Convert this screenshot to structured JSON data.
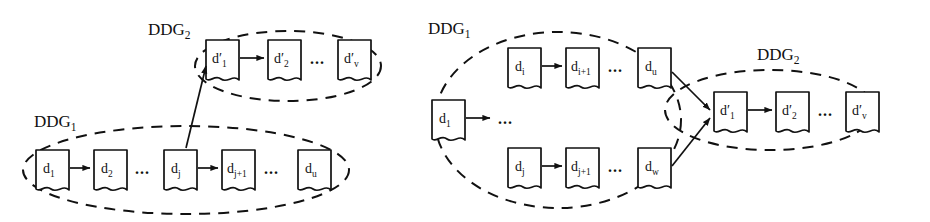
{
  "figure": {
    "type": "diagram",
    "ellipsis": "...",
    "colors": {
      "stroke": "#111111",
      "background": "#ffffff",
      "node_fill": "#ffffff"
    },
    "panels": [
      {
        "id": "panel-left",
        "name": "single-link-between-ddgs",
        "groups": [
          {
            "id": "left-ddg2",
            "label_base": "DDG",
            "label_sub": "2",
            "label": "DDG2",
            "nodes": [
              {
                "id": "l-dp1",
                "base": "d′",
                "sub": "1",
                "label": "d′1"
              },
              {
                "id": "l-dp2",
                "base": "d′",
                "sub": "2",
                "label": "d′2"
              },
              {
                "id": "l-dpv",
                "base": "d′",
                "sub": "v",
                "label": "d′v"
              }
            ]
          },
          {
            "id": "left-ddg1",
            "label_base": "DDG",
            "label_sub": "1",
            "label": "DDG1",
            "nodes": [
              {
                "id": "l-d1",
                "base": "d",
                "sub": "1",
                "label": "d1"
              },
              {
                "id": "l-d2",
                "base": "d",
                "sub": "2",
                "label": "d2"
              },
              {
                "id": "l-dj",
                "base": "d",
                "sub": "j",
                "label": "dj"
              },
              {
                "id": "l-dj1",
                "base": "d",
                "sub": "j+1",
                "label": "dj+1"
              },
              {
                "id": "l-du",
                "base": "d",
                "sub": "u",
                "label": "du"
              }
            ]
          }
        ],
        "edges": [
          {
            "from": "l-d1",
            "to": "l-d2",
            "kind": "intra-group"
          },
          {
            "from": "l-dj",
            "to": "l-dj1",
            "kind": "intra-group"
          },
          {
            "from": "l-dp1",
            "to": "l-dp2",
            "kind": "intra-group"
          },
          {
            "from": "l-dj",
            "to": "l-dp1",
            "kind": "cross-group"
          }
        ]
      },
      {
        "id": "panel-right",
        "name": "multi-link-between-ddgs",
        "groups": [
          {
            "id": "right-ddg1",
            "label_base": "DDG",
            "label_sub": "1",
            "label": "DDG1",
            "nodes": [
              {
                "id": "r-d1",
                "base": "d",
                "sub": "1",
                "label": "d1"
              },
              {
                "id": "r-di",
                "base": "d",
                "sub": "i",
                "label": "di"
              },
              {
                "id": "r-di1",
                "base": "d",
                "sub": "i+1",
                "label": "di+1"
              },
              {
                "id": "r-du",
                "base": "d",
                "sub": "u",
                "label": "du"
              },
              {
                "id": "r-dj",
                "base": "d",
                "sub": "j",
                "label": "dj"
              },
              {
                "id": "r-dj1",
                "base": "d",
                "sub": "j+1",
                "label": "dj+1"
              },
              {
                "id": "r-dw",
                "base": "d",
                "sub": "w",
                "label": "dw"
              }
            ]
          },
          {
            "id": "right-ddg2",
            "label_base": "DDG",
            "label_sub": "2",
            "label": "DDG2",
            "nodes": [
              {
                "id": "r-dp1",
                "base": "d′",
                "sub": "1",
                "label": "d′1"
              },
              {
                "id": "r-dp2",
                "base": "d′",
                "sub": "2",
                "label": "d′2"
              },
              {
                "id": "r-dpv",
                "base": "d′",
                "sub": "v",
                "label": "d′v"
              }
            ]
          }
        ],
        "edges": [
          {
            "from": "r-d1",
            "to": "ellipsis",
            "kind": "intra-group"
          },
          {
            "from": "r-di",
            "to": "r-di1",
            "kind": "intra-group"
          },
          {
            "from": "r-dj",
            "to": "r-dj1",
            "kind": "intra-group"
          },
          {
            "from": "r-dp1",
            "to": "r-dp2",
            "kind": "intra-group"
          },
          {
            "from": "r-du",
            "to": "r-dp1",
            "kind": "cross-group"
          },
          {
            "from": "r-dw",
            "to": "r-dp1",
            "kind": "cross-group"
          }
        ]
      }
    ]
  }
}
